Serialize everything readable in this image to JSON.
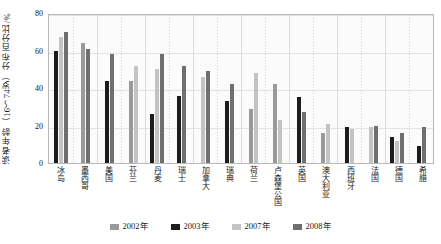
{
  "chart_data": {
    "type": "bar",
    "title": "",
    "xlabel": "",
    "ylabel": "读者年龄（16～74岁）分布百分比/%",
    "ylim": [
      0,
      80
    ],
    "yticks": [
      0,
      20,
      40,
      60,
      80
    ],
    "grid": true,
    "legend_position": "bottom",
    "categories": [
      "冰岛",
      "墨西哥",
      "美国",
      "芬兰",
      "丹麦",
      "瑞士",
      "加拿大",
      "瑞典",
      "荷兰",
      "卢森堡公国",
      "英国",
      "澳大利亚",
      "西班牙",
      "法国",
      "德国",
      "希腊"
    ],
    "series": [
      {
        "name": "2002年",
        "color": "#9a9a9a",
        "values": [
          null,
          64,
          null,
          44,
          null,
          null,
          null,
          null,
          29,
          42,
          null,
          16,
          null,
          null,
          null,
          null
        ]
      },
      {
        "name": "2003年",
        "color": "#1c1c1c",
        "values": [
          60,
          null,
          44,
          null,
          26,
          36,
          null,
          33,
          null,
          null,
          35,
          null,
          19,
          null,
          14,
          9
        ]
      },
      {
        "name": "2007年",
        "color": "#c3c3c3",
        "values": [
          67,
          null,
          null,
          52,
          50,
          null,
          46,
          null,
          48,
          23,
          null,
          21,
          18,
          19,
          12,
          null
        ]
      },
      {
        "name": "2008年",
        "color": "#6f6f6f",
        "values": [
          70,
          61,
          58,
          null,
          58,
          52,
          49,
          42,
          null,
          null,
          27,
          null,
          null,
          20,
          16,
          19
        ]
      }
    ]
  },
  "legend": {
    "items": [
      {
        "label": "2002年",
        "color": "#9a9a9a"
      },
      {
        "label": "2003年",
        "color": "#1c1c1c"
      },
      {
        "label": "2007年",
        "color": "#c3c3c3"
      },
      {
        "label": "2008年",
        "color": "#6f6f6f"
      }
    ]
  }
}
